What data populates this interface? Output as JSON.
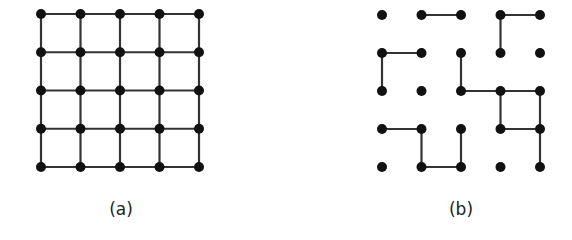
{
  "figures": [
    {
      "id": "a",
      "caption": "(a)",
      "grid": {
        "cols": 5,
        "rows": 5,
        "origin": [
          41,
          14
        ],
        "spacing_x": 39.5,
        "spacing_y": 38.25
      },
      "edges": "full"
    },
    {
      "id": "b",
      "caption": "(b)",
      "grid": {
        "cols": 5,
        "rows": 5,
        "origin": [
          382,
          15
        ],
        "spacing_x": 39.5,
        "spacing_y": 38.0
      },
      "edges": [
        [
          [
            1,
            0
          ],
          [
            2,
            0
          ]
        ],
        [
          [
            3,
            0
          ],
          [
            4,
            0
          ]
        ],
        [
          [
            3,
            0
          ],
          [
            3,
            1
          ]
        ],
        [
          [
            0,
            1
          ],
          [
            1,
            1
          ]
        ],
        [
          [
            0,
            1
          ],
          [
            0,
            2
          ]
        ],
        [
          [
            2,
            1
          ],
          [
            2,
            2
          ]
        ],
        [
          [
            2,
            2
          ],
          [
            3,
            2
          ]
        ],
        [
          [
            3,
            2
          ],
          [
            4,
            2
          ]
        ],
        [
          [
            3,
            2
          ],
          [
            3,
            3
          ]
        ],
        [
          [
            4,
            2
          ],
          [
            4,
            3
          ]
        ],
        [
          [
            3,
            3
          ],
          [
            4,
            3
          ]
        ],
        [
          [
            4,
            3
          ],
          [
            4,
            4
          ]
        ],
        [
          [
            0,
            3
          ],
          [
            1,
            3
          ]
        ],
        [
          [
            1,
            3
          ],
          [
            1,
            4
          ]
        ],
        [
          [
            1,
            4
          ],
          [
            2,
            4
          ]
        ],
        [
          [
            2,
            3
          ],
          [
            2,
            4
          ]
        ]
      ]
    }
  ],
  "style": {
    "node_color": "#111111",
    "edge_color": "#333333",
    "node_radius": 5,
    "edge_width": 2.2
  }
}
